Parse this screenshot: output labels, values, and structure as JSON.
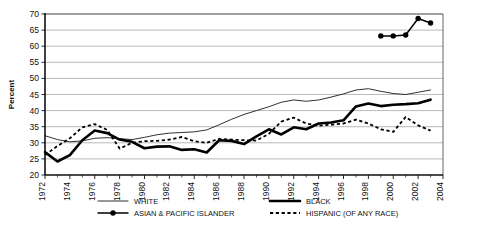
{
  "chart_data": {
    "type": "line",
    "title": "",
    "xlabel": "",
    "ylabel": "Percent",
    "xlim": [
      1972,
      2004
    ],
    "ylim": [
      20,
      70
    ],
    "yticks": [
      20,
      25,
      30,
      35,
      40,
      45,
      50,
      55,
      60,
      65,
      70
    ],
    "xticks": [
      1972,
      1974,
      1976,
      1978,
      1980,
      1982,
      1984,
      1986,
      1988,
      1990,
      1992,
      1994,
      1996,
      1998,
      2000,
      2002,
      2004
    ],
    "grid": "horizontal",
    "legend_position": "bottom",
    "series": [
      {
        "name": "WHITE",
        "style": "thin-solid",
        "x": [
          1972,
          1973,
          1974,
          1975,
          1976,
          1977,
          1978,
          1979,
          1980,
          1981,
          1982,
          1983,
          1984,
          1985,
          1986,
          1987,
          1988,
          1989,
          1990,
          1991,
          1992,
          1993,
          1994,
          1995,
          1996,
          1997,
          1998,
          1999,
          2000,
          2001,
          2002,
          2003
        ],
        "values": [
          32.2,
          31.0,
          30.3,
          30.6,
          31.4,
          31.6,
          31.3,
          31.0,
          31.7,
          32.5,
          33.0,
          33.2,
          33.4,
          34.0,
          35.6,
          37.3,
          38.8,
          40.0,
          41.2,
          42.6,
          43.3,
          42.9,
          43.3,
          44.2,
          45.2,
          46.4,
          46.8,
          46.0,
          45.3,
          45.0,
          45.7,
          46.4
        ]
      },
      {
        "name": "BLACK",
        "style": "thick-solid",
        "x": [
          1972,
          1973,
          1974,
          1975,
          1976,
          1977,
          1978,
          1979,
          1980,
          1981,
          1982,
          1983,
          1984,
          1985,
          1986,
          1987,
          1988,
          1989,
          1990,
          1991,
          1992,
          1993,
          1994,
          1995,
          1996,
          1997,
          1998,
          1999,
          2000,
          2001,
          2002,
          2003
        ],
        "values": [
          27.1,
          24.2,
          26.2,
          30.8,
          33.8,
          33.0,
          31.0,
          30.3,
          28.3,
          28.8,
          28.9,
          27.8,
          28.0,
          27.0,
          30.8,
          30.6,
          29.6,
          32.0,
          34.2,
          32.6,
          34.8,
          34.2,
          36.0,
          36.3,
          37.0,
          41.3,
          42.2,
          41.4,
          41.8,
          42.0,
          42.3,
          43.4
        ]
      },
      {
        "name": "HISPANIC (OF ANY RACE)",
        "style": "dashed",
        "x": [
          1972,
          1973,
          1974,
          1975,
          1976,
          1977,
          1978,
          1979,
          1980,
          1981,
          1982,
          1983,
          1984,
          1985,
          1986,
          1987,
          1988,
          1989,
          1990,
          1991,
          1992,
          1993,
          1994,
          1995,
          1996,
          1997,
          1998,
          1999,
          2000,
          2001,
          2002,
          2003
        ],
        "values": [
          26.2,
          29.0,
          31.4,
          34.8,
          35.8,
          34.0,
          28.2,
          30.0,
          30.5,
          30.6,
          31.0,
          31.8,
          30.5,
          30.0,
          31.2,
          31.0,
          30.8,
          30.7,
          32.8,
          36.6,
          37.8,
          36.0,
          35.3,
          35.6,
          36.0,
          37.2,
          36.0,
          34.2,
          33.4,
          38.0,
          35.4,
          33.8
        ]
      },
      {
        "name": "ASIAN & PACIFIC ISLANDER",
        "style": "marker-line",
        "x": [
          1999,
          2000,
          2001,
          2002,
          2003
        ],
        "values": [
          63.2,
          63.2,
          63.5,
          68.6,
          67.2
        ]
      }
    ],
    "legend": [
      {
        "label": "WHITE",
        "style": "thin-solid"
      },
      {
        "label": "BLACK",
        "style": "thick-solid"
      },
      {
        "label": "ASIAN & PACIFIC ISLANDER",
        "style": "marker-line"
      },
      {
        "label": "HISPANIC (OF ANY RACE)",
        "style": "dashed"
      }
    ]
  }
}
